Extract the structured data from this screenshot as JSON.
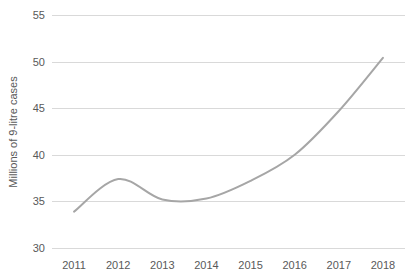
{
  "chart_data": {
    "type": "line",
    "title": "",
    "subtitle": "",
    "xlabel": "",
    "ylabel": "Millions of 9-litre cases",
    "categories": [
      "2011",
      "2012",
      "2013",
      "2014",
      "2015",
      "2016",
      "2017",
      "2018"
    ],
    "x": [
      2011,
      2012,
      2013,
      2014,
      2015,
      2016,
      2017,
      2018
    ],
    "series": [
      {
        "name": "",
        "color": "#a6a6a6",
        "smooth": true,
        "values": [
          33.9,
          37.4,
          35.2,
          35.3,
          37.2,
          40.0,
          44.7,
          50.4
        ]
      }
    ],
    "ylim": [
      30,
      55
    ],
    "yticks": [
      30,
      35,
      40,
      45,
      50,
      55
    ],
    "ytick_labels": [
      "30",
      "35",
      "40",
      "45",
      "50",
      "55"
    ],
    "xtick_labels": [
      "2011",
      "2012",
      "2013",
      "2014",
      "2015",
      "2016",
      "2017",
      "2018"
    ],
    "grid": {
      "horizontal": true,
      "vertical": false,
      "color": "#d9d9d9"
    },
    "legend": {
      "visible": false,
      "position": "none",
      "entries": []
    },
    "annotations": [],
    "axis_line_visible": false,
    "markers_visible": false,
    "background_color": "#ffffff",
    "text_color": "#595959"
  },
  "layout": {
    "plot_left": 52,
    "plot_right": 405,
    "plot_top": 15,
    "plot_bottom": 248
  }
}
